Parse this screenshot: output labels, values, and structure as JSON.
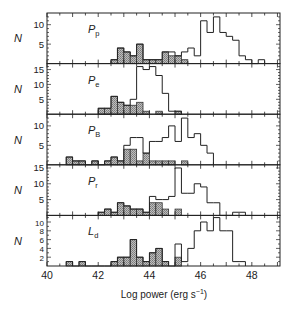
{
  "chart_data": {
    "type": "bar",
    "title": "",
    "xlabel": "Log power (erg s⁻¹)",
    "ylabel": "N",
    "xlim": [
      40,
      49.1
    ],
    "x_ticks": [
      40,
      42,
      44,
      46,
      48
    ],
    "bin_width": 0.25,
    "panels": [
      {
        "label": "P",
        "subscript": "p",
        "ylim": [
          0,
          13
        ],
        "y_ticks": [
          5,
          10
        ],
        "series": [
          {
            "name": "total (open)",
            "bins_start": 42.5,
            "values": [
              1,
              4,
              3,
              2,
              5,
              1,
              1,
              1,
              3,
              3,
              2,
              3,
              4,
              2,
              11,
              8,
              12,
              8,
              7,
              6,
              2,
              1,
              0,
              1
            ]
          },
          {
            "name": "subset (hatched)",
            "bins_start": 42.5,
            "values": [
              1,
              4,
              3,
              2,
              5,
              1,
              1,
              1,
              3,
              2,
              2,
              1
            ]
          }
        ]
      },
      {
        "label": "P",
        "subscript": "e",
        "ylim": [
          0,
          17
        ],
        "y_ticks": [
          5,
          10,
          15
        ],
        "series": [
          {
            "name": "total (open)",
            "bins_start": 42.0,
            "values": [
              2,
              2,
              6,
              4,
              3,
              5,
              16,
              15,
              16,
              13,
              7,
              1,
              1
            ]
          },
          {
            "name": "subset (hatched)",
            "bins_start": 42.0,
            "values": [
              2,
              2,
              6,
              4,
              3,
              3,
              4,
              1,
              0,
              1,
              0,
              0,
              1
            ]
          }
        ]
      },
      {
        "label": "P",
        "subscript": "B",
        "ylim": [
          0,
          13
        ],
        "y_ticks": [
          5,
          10
        ],
        "series": [
          {
            "name": "total (open)",
            "bins_start": 40.75,
            "values": [
              2,
              1,
              1,
              0,
              1,
              0,
              1,
              2,
              1,
              5,
              7,
              7,
              3,
              6,
              6,
              7,
              10,
              6,
              12,
              7,
              8,
              5,
              3
            ]
          },
          {
            "name": "subset (hatched)",
            "bins_start": 40.75,
            "values": [
              2,
              1,
              1,
              0,
              1,
              0,
              1,
              2,
              1,
              4,
              4,
              1,
              3,
              1,
              1,
              1,
              1,
              0,
              1
            ]
          }
        ]
      },
      {
        "label": "P",
        "subscript": "r",
        "ylim": [
          0,
          16
        ],
        "y_ticks": [
          5,
          10,
          15
        ],
        "series": [
          {
            "name": "total (open)",
            "bins_start": 42.0,
            "values": [
              1,
              2,
              1,
              4,
              3,
              2,
              2,
              1,
              6,
              5,
              5,
              6,
              15,
              7,
              7,
              10,
              9,
              4,
              4,
              0,
              0,
              1,
              1
            ]
          },
          {
            "name": "subset (hatched)",
            "bins_start": 42.0,
            "values": [
              1,
              2,
              1,
              4,
              3,
              2,
              2,
              1,
              4,
              4,
              2,
              0,
              2
            ]
          }
        ]
      },
      {
        "label": "L",
        "subscript": "d",
        "ylim": [
          0,
          11.5
        ],
        "y_ticks": [
          2,
          4,
          6,
          8,
          10
        ],
        "series": [
          {
            "name": "total (open)",
            "bins_start": 40.75,
            "values": [
              1,
              0,
              1,
              0,
              0,
              0,
              0,
              1,
              2,
              2,
              6,
              2,
              1,
              3,
              4,
              1,
              0,
              5,
              1,
              4,
              8,
              10,
              8,
              11,
              8,
              8,
              1,
              1
            ]
          },
          {
            "name": "subset (hatched)",
            "bins_start": 40.75,
            "values": [
              1,
              0,
              1,
              0,
              0,
              0,
              0,
              1,
              2,
              2,
              6,
              2,
              1,
              3,
              4,
              1,
              0,
              2
            ]
          }
        ]
      }
    ]
  },
  "axis": {
    "tick_labels": [
      "40",
      "42",
      "44",
      "46",
      "48"
    ],
    "xlabel_main": "Log power (erg s",
    "xlabel_sup": "−1",
    "xlabel_end": ")",
    "ylabel": "N"
  }
}
